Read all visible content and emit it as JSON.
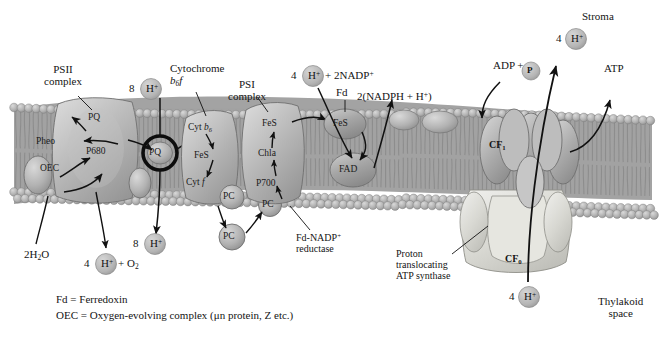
{
  "diagram": {
    "type": "biological-membrane-diagram",
    "compartments": {
      "stroma_label": "Stroma",
      "thylakoid_label_line1": "Thylakoid",
      "thylakoid_label_line2": "space"
    },
    "complex_labels": {
      "psii_line1": "PSII",
      "psii_line2": "complex",
      "cytochrome_line1": "Cytochrome",
      "cytochrome_line2_main": "b",
      "cytochrome_line2_sub": "6",
      "cytochrome_line2_tail": "f",
      "psi_line1": "PSI",
      "psi_line2": "complex",
      "fd_label": "Fd",
      "reductase_line1": "Fd-NADP",
      "reductase_line1_sup": "+",
      "reductase_line2": "reductase",
      "atpsynthase_line1": "Proton",
      "atpsynthase_line2": "translocating",
      "atpsynthase_line3": "ATP synthase",
      "cf1_main": "CF",
      "cf1_sub": "1",
      "cf0_main": "CF",
      "cf0_sub": "0"
    },
    "carriers": {
      "psii_pq": "PQ",
      "psii_pheo": "Pheo",
      "psii_p680": "P680",
      "psii_oec": "OEC",
      "pq_pool": "PQ",
      "cyt_b6_main": "Cyt ",
      "cyt_b6_ital": "b",
      "cyt_b6_sub": "6",
      "cyt_fes": "FeS",
      "cyt_f_main": "Cyt ",
      "cyt_f_ital": "f",
      "pc_membrane": "PC",
      "pc_lumen": "PC",
      "pc_psi": "PC",
      "psi_fes": "FeS",
      "psi_chla": "Chla",
      "psi_p700": "P700",
      "fd_fes": "FeS",
      "fad": "FAD"
    },
    "reactions": {
      "h_plus_8_top_count": "8",
      "h_plus_8_top_ion": "H",
      "h_plus_8_top_charge": "+",
      "h_plus_8_bottom_count": "8",
      "h_plus_8_bottom_ion": "H",
      "h_plus_8_bottom_charge": "+",
      "water_input": "2H",
      "water_sub": "2",
      "water_tail": "O",
      "oxygen_out_count": "4",
      "oxygen_out_ion": "H",
      "oxygen_out_charge": "+",
      "oxygen_out_plus": " + O",
      "oxygen_out_sub": "2",
      "nadp_in_count": "4",
      "nadp_in_ion": "H",
      "nadp_in_charge": "+",
      "nadp_in_tail": " + 2NADP",
      "nadp_in_tail_sup": "+",
      "nadph_out": "2(NADPH + H",
      "nadph_out_sup": "+",
      "nadph_out_close": ")",
      "adp_text": "ADP + ",
      "adp_pi": "P",
      "atp_text": "ATP",
      "h_plus_4_stroma_count": "4",
      "h_plus_4_stroma_ion": "H",
      "h_plus_4_stroma_charge": "+",
      "h_plus_4_lumen_count": "4",
      "h_plus_4_lumen_ion": "H",
      "h_plus_4_lumen_charge": "+"
    },
    "legend": {
      "line1": "Fd = Ferredoxin",
      "line2": "OEC = Oxygen-evolving complex (μn protein, Z etc.)"
    },
    "colors": {
      "membrane_gray": "#a8a8a8",
      "headgroup_gray": "#b9b9b9",
      "protein_gray": "#9c9c9c",
      "protein_light": "#c9c9c9",
      "atpsynthase_light": "#dcdcd6",
      "ion_gray": "#bdbdbd",
      "outline": "#2b2b2b",
      "text": "#141414"
    }
  }
}
